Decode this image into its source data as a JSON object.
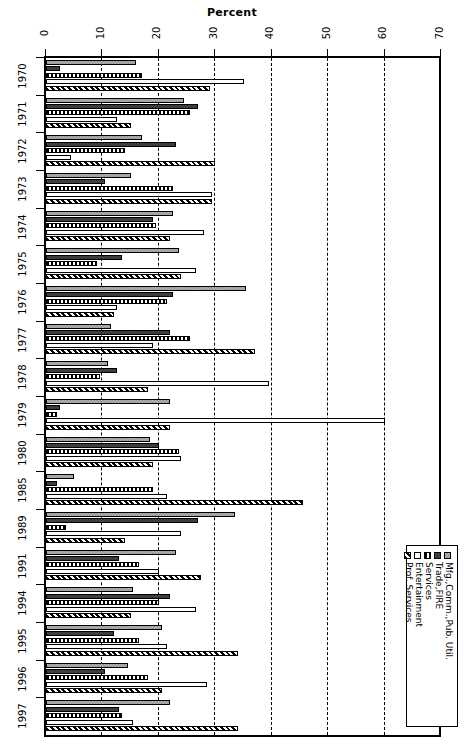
{
  "chart_data": {
    "type": "bar",
    "orientation": "horizontal",
    "title": "Percent",
    "xlabel": "Percent",
    "ylabel": "",
    "xlim": [
      0,
      70
    ],
    "xticks": [
      0,
      10,
      20,
      30,
      40,
      50,
      60,
      70
    ],
    "grid": "vertical-dashed",
    "legend_position": "bottom-right",
    "categories": [
      "1970",
      "1971",
      "1972",
      "1973",
      "1974",
      "1975",
      "1976",
      "1977",
      "1978",
      "1979",
      "1980",
      "1985",
      "1989",
      "1991",
      "1994",
      "1995",
      "1996",
      "1997"
    ],
    "series": [
      {
        "name": "Mfg.,Comm.,Pub. Util.",
        "pattern": "light-gray-checker",
        "values": [
          16.0,
          24.5,
          17.0,
          15.0,
          22.5,
          23.5,
          35.5,
          11.5,
          11.0,
          22.0,
          18.5,
          5.0,
          33.5,
          23.0,
          15.5,
          20.5,
          14.5,
          22.0
        ]
      },
      {
        "name": "Trade,FIRE",
        "pattern": "dark-checker",
        "values": [
          2.5,
          27.0,
          23.0,
          10.5,
          19.0,
          13.5,
          22.5,
          22.0,
          12.5,
          2.5,
          20.0,
          2.0,
          27.0,
          13.0,
          22.0,
          12.0,
          10.5,
          13.0
        ]
      },
      {
        "name": "Services",
        "pattern": "vertical-stripes",
        "values": [
          17.0,
          25.5,
          14.0,
          22.5,
          19.5,
          9.0,
          21.5,
          25.5,
          9.5,
          2.0,
          23.5,
          19.0,
          3.5,
          16.5,
          20.0,
          16.5,
          18.0,
          13.5
        ]
      },
      {
        "name": "Entertainment",
        "pattern": "empty-white",
        "values": [
          35.0,
          12.5,
          4.5,
          29.5,
          28.0,
          26.5,
          12.5,
          19.0,
          39.5,
          60.0,
          24.0,
          21.5,
          24.0,
          20.0,
          26.5,
          21.5,
          28.5,
          15.5
        ]
      },
      {
        "name": "Prof. Services",
        "pattern": "diagonal-hatch",
        "values": [
          29.0,
          15.0,
          30.0,
          29.5,
          22.0,
          24.0,
          12.0,
          37.0,
          18.0,
          22.0,
          19.0,
          45.5,
          14.0,
          27.5,
          15.0,
          34.0,
          20.5,
          34.0
        ]
      }
    ]
  },
  "legend": {
    "items": [
      {
        "label": "Mfg.,Comm.,Pub. Util."
      },
      {
        "label": "Trade,FIRE"
      },
      {
        "label": "Services"
      },
      {
        "label": "Entertainment"
      },
      {
        "label": "Prof. Services"
      }
    ]
  }
}
